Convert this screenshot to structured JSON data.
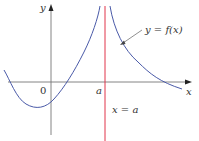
{
  "figure": {
    "y_axis_label": "y",
    "x_axis_label": "x",
    "origin_label": "0",
    "a_tick_label": "a",
    "curve_label": "y = f(x)",
    "asymptote_label": "x = a",
    "colors": {
      "axes": "#666666",
      "curve": "#4a5aa8",
      "asymptote": "#e0344a",
      "text": "#333333"
    }
  }
}
